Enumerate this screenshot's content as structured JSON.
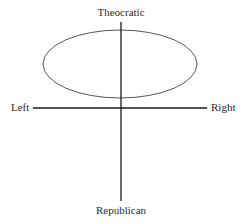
{
  "diagram": {
    "type": "political-axes",
    "labels": {
      "top": "Theocratic",
      "bottom": "Republican",
      "left": "Left",
      "right": "Right"
    },
    "axes": {
      "horizontal": {
        "x1": 33,
        "x2": 207,
        "y": 108
      },
      "vertical": {
        "x": 121,
        "y1": 22,
        "y2": 201
      }
    },
    "ellipse": {
      "cx": 120,
      "cy": 64,
      "rx": 77,
      "ry": 34
    },
    "colors": {
      "axis": "#1a1a1a",
      "ellipse": "#555555",
      "text": "#2a2a2a",
      "background": "#ffffff"
    }
  }
}
